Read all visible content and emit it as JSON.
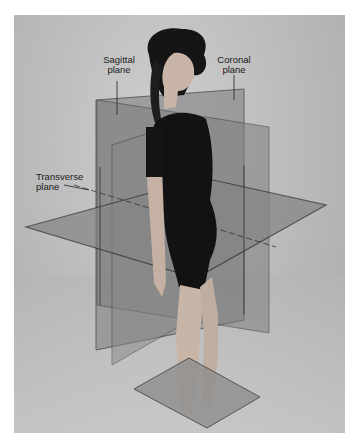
{
  "figure": {
    "colors": {
      "background": "#bdbdbd",
      "plane_fill": "#8a8a8a",
      "plane_edge": "#3a3a3a",
      "leotard": "#111111",
      "skin": "#c9b8ac",
      "hair": "#141414"
    }
  },
  "labels": {
    "sagittal": {
      "line1": "Sagittal",
      "line2": "plane"
    },
    "coronal": {
      "line1": "Coronal",
      "line2": "plane"
    },
    "transverse": {
      "line1": "Transverse",
      "line2": "plane"
    }
  }
}
